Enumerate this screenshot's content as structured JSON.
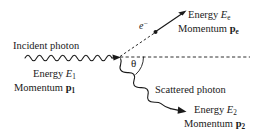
{
  "diagram": {
    "background_color": "#ffffff",
    "stroke_color": "#1a1a1a",
    "labels": {
      "incident_photon": "Incident photon",
      "scattered_photon": "Scattered photon",
      "electron": "e",
      "electron_charge_sup": "−",
      "theta": "θ",
      "energy_word": "Energy",
      "momentum_word": "Momentum",
      "energy_symbol": "E",
      "momentum_symbol": "p",
      "incident_subscript": "1",
      "scattered_subscript": "2",
      "electron_subscript": "e"
    },
    "elements": {
      "incident_photon": {
        "name": "incident-photon-wave",
        "energy": "E",
        "energy_sub": "1",
        "momentum": "p",
        "momentum_sub": "1",
        "direction": "rightward",
        "wave_cycles": 8
      },
      "scattered_photon": {
        "name": "scattered-photon-wave",
        "energy": "E",
        "energy_sub": "2",
        "momentum": "p",
        "momentum_sub": "2",
        "direction": "down-right",
        "angle_deg": -35,
        "wave_cycles": 4
      },
      "recoil_electron": {
        "name": "recoil-electron-arrow",
        "energy": "E",
        "energy_sub": "e",
        "momentum": "p",
        "momentum_sub": "e",
        "direction": "up-right",
        "angle_deg": 33
      },
      "scattering_angle": {
        "name": "scattering-angle-theta",
        "symbol": "θ",
        "measured_from": "incident axis"
      },
      "axis": {
        "name": "incident-axis-dashed-line",
        "style": "dashed",
        "orientation": "horizontal"
      }
    },
    "geometry": {
      "vertex": {
        "x": 120,
        "y": 57
      },
      "electron_dot": {
        "x": 155,
        "y": 32
      },
      "axis_end": {
        "x": 250,
        "y": 57
      }
    }
  }
}
